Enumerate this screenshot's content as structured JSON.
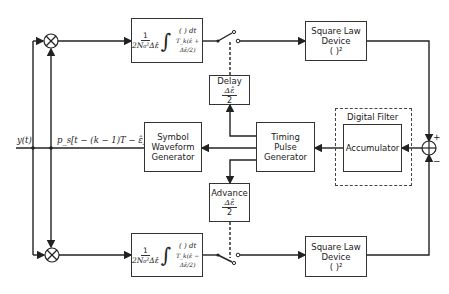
{
  "diagram": {
    "input_label": "y(t)",
    "reference_label": "p_s[t − (k − 1)T − ε̂]",
    "top_branch": {
      "integrator": {
        "gain_num": "1",
        "gain_den": "2N₀²Δε̂",
        "integrand": "( ) dt",
        "limits": "T_k(ε̂ + Δε̂/2)"
      },
      "square_law": {
        "line1": "Square Law",
        "line2": "Device",
        "line3": "( )²"
      }
    },
    "bottom_branch": {
      "integrator": {
        "gain_num": "1",
        "gain_den": "2N₀²Δε̂",
        "integrand": "( ) dt",
        "limits": "T_k(ε̂ − Δε̂/2)"
      },
      "square_law": {
        "line1": "Square Law",
        "line2": "Device",
        "line3": "( )²"
      }
    },
    "delay": {
      "title": "Delay",
      "num": "Δε̂",
      "den": "2"
    },
    "advance": {
      "title": "Advance",
      "num": "Δε̂",
      "den": "2"
    },
    "symbol_waveform_generator": {
      "line1": "Symbol",
      "line2": "Waveform",
      "line3": "Generator"
    },
    "timing_pulse_generator": {
      "line1": "Timing",
      "line2": "Pulse",
      "line3": "Generator"
    },
    "digital_filter": {
      "title": "Digital Filter",
      "accumulator": "Accumulator"
    },
    "summer": {
      "plus": "+",
      "minus": "−"
    }
  }
}
